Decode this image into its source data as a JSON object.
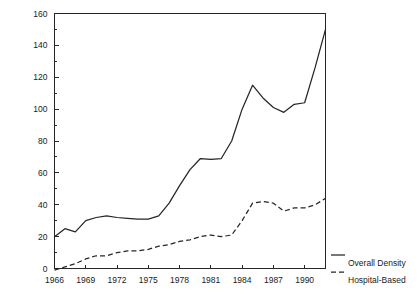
{
  "chart_data": {
    "type": "line",
    "title": "",
    "subtitle": "",
    "xlabel": "",
    "ylabel": "",
    "xlim": [
      1966,
      1992
    ],
    "ylim": [
      0,
      160
    ],
    "grid": false,
    "legend_position": "right",
    "y_ticks": [
      "0",
      "20",
      "40",
      "60",
      "80",
      "100",
      "120",
      "140",
      "160"
    ],
    "y_tick_values": [
      0,
      20,
      40,
      60,
      80,
      100,
      120,
      140,
      160
    ],
    "y_minor_step": 10,
    "x_ticks": [
      "1966",
      "1969",
      "1972",
      "1975",
      "1978",
      "1981",
      "1984",
      "1987",
      "1990"
    ],
    "x_tick_values": [
      1966,
      1969,
      1972,
      1975,
      1978,
      1981,
      1984,
      1987,
      1990
    ],
    "x": [
      1966,
      1967,
      1968,
      1969,
      1970,
      1971,
      1972,
      1973,
      1974,
      1975,
      1976,
      1977,
      1978,
      1979,
      1980,
      1981,
      1982,
      1983,
      1984,
      1985,
      1986,
      1987,
      1988,
      1989,
      1990,
      1991,
      1992
    ],
    "series": [
      {
        "name": "Overall Density",
        "style": "solid",
        "color": "#262626",
        "values": [
          20,
          25,
          23,
          30,
          32,
          33,
          32,
          31.5,
          31,
          31,
          33,
          41,
          52,
          62,
          69,
          68.5,
          69,
          80,
          100,
          115,
          107,
          101,
          98,
          103,
          104,
          126,
          150
        ]
      },
      {
        "name": "Hospital-Based",
        "style": "dashed",
        "color": "#262626",
        "values": [
          -1,
          1,
          3,
          6,
          8,
          8,
          10,
          11,
          11,
          12,
          14,
          15,
          17,
          18,
          20,
          21,
          20,
          21,
          30,
          41,
          42,
          41,
          36,
          38,
          38,
          40,
          44
        ]
      }
    ]
  },
  "legend": {
    "items": [
      {
        "label": "Overall Density",
        "style": "solid"
      },
      {
        "label": "Hospital-Based",
        "style": "dashed"
      }
    ]
  }
}
